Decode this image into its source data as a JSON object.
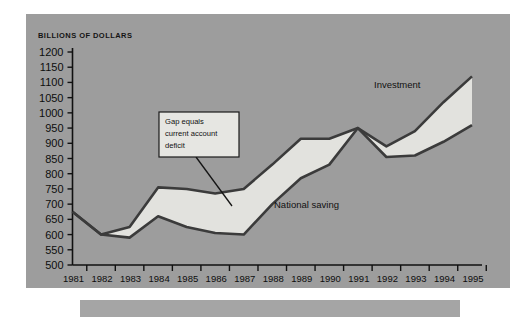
{
  "panel": {
    "background_color": "#9d9d9d",
    "footer_bar_color": "#a5a5a5",
    "page_background": "#ffffff"
  },
  "chart_data": {
    "type": "line",
    "title": "",
    "subtitle": "",
    "axis_header": "BILLIONS OF DOLLARS",
    "xlabel": "",
    "ylabel": "BILLIONS OF DOLLARS",
    "grid": false,
    "legend_position": "inline-annotation",
    "ylim": [
      500,
      1200
    ],
    "ytick_step": 50,
    "ytick_labels": [
      "1200",
      "1150",
      "1100",
      "1050",
      "1000",
      "950",
      "900",
      "850",
      "800",
      "750",
      "700",
      "650",
      "600",
      "550",
      "500"
    ],
    "ytick_values": [
      1200,
      1150,
      1100,
      1050,
      1000,
      950,
      900,
      850,
      800,
      750,
      700,
      650,
      600,
      550,
      500
    ],
    "categories": [
      "1981",
      "1982",
      "1983",
      "1984",
      "1985",
      "1986",
      "1987",
      "1988",
      "1989",
      "1990",
      "1991",
      "1992",
      "1993",
      "1994",
      "1995"
    ],
    "x": [
      1981,
      1982,
      1983,
      1984,
      1985,
      1986,
      1987,
      1988,
      1989,
      1990,
      1991,
      1992,
      1993,
      1994,
      1995
    ],
    "series": [
      {
        "name": "Investment",
        "label": "Investment",
        "color": "#3b3b3b",
        "values": [
          675,
          600,
          625,
          755,
          750,
          735,
          750,
          830,
          915,
          915,
          950,
          890,
          940,
          1035,
          1120
        ]
      },
      {
        "name": "National saving",
        "label": "National saving",
        "color": "#3b3b3b",
        "values": [
          675,
          600,
          590,
          660,
          625,
          605,
          600,
          700,
          785,
          830,
          950,
          855,
          860,
          905,
          960
        ]
      }
    ],
    "fill_between": {
      "label": "Gap equals current account deficit",
      "color": "#e2e2de"
    },
    "annotations": [
      {
        "name": "gap-callout",
        "text_lines": [
          "Gap equals",
          "current account",
          "deficit"
        ],
        "text": "Gap equals current account deficit",
        "box_fill": "#e6e6e2",
        "box_stroke": "#1a1a1a"
      },
      {
        "name": "investment-label",
        "text": "Investment"
      },
      {
        "name": "national-saving-label",
        "text": "National saving"
      }
    ]
  }
}
